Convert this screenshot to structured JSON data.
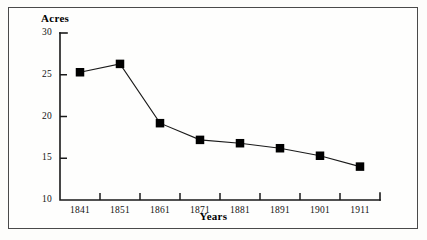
{
  "figure": {
    "background": "#fdfdfb",
    "frame_color": "#4a4a4a",
    "ink_color": "#000000"
  },
  "chart_data": {
    "type": "line",
    "title": "",
    "xlabel": "Years",
    "ylabel": "Acres",
    "categories": [
      "1841",
      "1851",
      "1861",
      "1871",
      "1881",
      "1891",
      "1901",
      "1911"
    ],
    "x": [
      1841,
      1851,
      1861,
      1871,
      1881,
      1891,
      1901,
      1911
    ],
    "values": [
      25.3,
      26.3,
      19.2,
      17.2,
      16.8,
      16.2,
      15.3,
      14.0
    ],
    "series": [
      {
        "name": "Acres",
        "values": [
          25.3,
          26.3,
          19.2,
          17.2,
          16.8,
          16.2,
          15.3,
          14.0
        ],
        "marker": "square",
        "marker_color": "#000000",
        "line_color": "#1a1a1a"
      }
    ],
    "ylim": [
      10,
      30
    ],
    "xlim": [
      1836,
      1916
    ],
    "ytick_labels": [
      "30",
      "25",
      "20",
      "15",
      "10"
    ],
    "yticks": [
      30,
      25,
      20,
      15,
      10
    ],
    "xtick_labels": [
      "1841",
      "1851",
      "1861",
      "1871",
      "1881",
      "1891",
      "1901",
      "1911"
    ],
    "grid": false,
    "legend": false,
    "legend_position": "none"
  },
  "axes": {
    "y_title": "Acres",
    "x_title": "Years"
  }
}
